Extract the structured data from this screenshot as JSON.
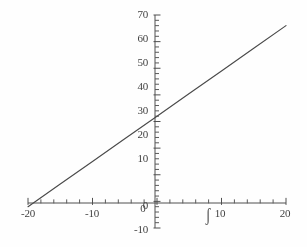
{
  "chart_data": {
    "type": "line",
    "title": "",
    "subtitle": "",
    "xlabel": "",
    "ylabel": "",
    "xlim": [
      -20,
      20
    ],
    "ylim": [
      -10,
      70
    ],
    "grid": false,
    "legend": null,
    "x_ticks": [
      -20,
      -10,
      0,
      10,
      20
    ],
    "x_tick_labels": [
      "-20",
      "-10",
      "0",
      "10",
      "20"
    ],
    "y_ticks": [
      -10,
      0,
      10,
      20,
      30,
      40,
      50,
      60,
      70
    ],
    "y_tick_labels": [
      "-10",
      "0",
      "10",
      "20",
      "30",
      "40",
      "50",
      "60",
      "70"
    ],
    "x_minor_tick_step": 2,
    "y_minor_tick_step": 2,
    "axis_style": "crossed-at-origin",
    "series": [
      {
        "name": "line",
        "type": "line",
        "color": "#444444",
        "x": [
          -20,
          -15,
          -10,
          -5,
          0,
          5,
          10,
          15,
          20
        ],
        "y": [
          -2,
          6.5,
          15,
          23.5,
          32,
          40.5,
          49,
          57.5,
          66
        ],
        "slope": 1.7,
        "y_intercept": 32,
        "x_intercept": -18.8
      }
    ],
    "annotations": [
      {
        "name": "stray-ink-mark",
        "text": "ʃ",
        "x": 10,
        "y": -10,
        "note": "scan artifact overlapping the x tick label 10"
      }
    ]
  },
  "colors": {
    "background": "#fefefe",
    "axis": "#4a4a4a",
    "tick": "#555555",
    "line": "#474747",
    "label": "#3a3a3a"
  }
}
